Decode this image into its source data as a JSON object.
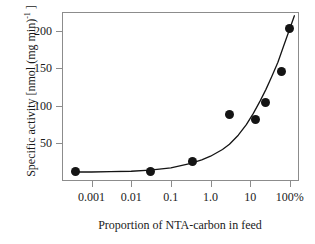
{
  "chart_data": {
    "type": "scatter",
    "title": "",
    "xlabel": "Proportion of NTA-carbon in feed",
    "ylabel": "Specific activity [nmol (mg min)",
    "ylabel_sup": "-1",
    "ylabel_tail": " ]",
    "xscale": "log",
    "yscale": "linear",
    "xlim": [
      0.00018,
      170
    ],
    "ylim": [
      0,
      225
    ],
    "grid": false,
    "legend": null,
    "xticks": [
      {
        "value": 0.001,
        "label": "0.001"
      },
      {
        "value": 0.01,
        "label": "0.01"
      },
      {
        "value": 0.1,
        "label": "0.1"
      },
      {
        "value": 1.0,
        "label": "1.0"
      },
      {
        "value": 10,
        "label": "10"
      },
      {
        "value": 100,
        "label": "100%"
      }
    ],
    "yticks": [
      {
        "value": 50,
        "label": "50"
      },
      {
        "value": 100,
        "label": "100"
      },
      {
        "value": 150,
        "label": "150"
      },
      {
        "value": 200,
        "label": "200"
      }
    ],
    "x": [
      0.0004,
      0.03,
      0.35,
      3.0,
      14,
      25,
      60,
      100
    ],
    "y": [
      13,
      12,
      26,
      88,
      82,
      105,
      146,
      203
    ],
    "points": [
      {
        "x": 0.0004,
        "y": 13
      },
      {
        "x": 0.03,
        "y": 12
      },
      {
        "x": 0.35,
        "y": 26
      },
      {
        "x": 3.0,
        "y": 88
      },
      {
        "x": 14,
        "y": 82
      },
      {
        "x": 25,
        "y": 105
      },
      {
        "x": 60,
        "y": 146
      },
      {
        "x": 100,
        "y": 203
      }
    ],
    "fit_curve": {
      "description": "monotonic increasing fitted curve through the data",
      "x": [
        0.0004,
        0.001,
        0.003,
        0.01,
        0.03,
        0.1,
        0.3,
        0.6,
        1.0,
        2.0,
        3.0,
        5.0,
        8.0,
        12,
        18,
        25,
        35,
        50,
        70,
        100,
        130
      ],
      "y": [
        12,
        12,
        12.4,
        13,
        14.5,
        17.5,
        23,
        28,
        33,
        42,
        49,
        61,
        75,
        90,
        107,
        122,
        139,
        158,
        180,
        203,
        220
      ]
    },
    "series_color": "#141414",
    "axis_color": "#8c8c8c",
    "curve_color": "#141414"
  }
}
